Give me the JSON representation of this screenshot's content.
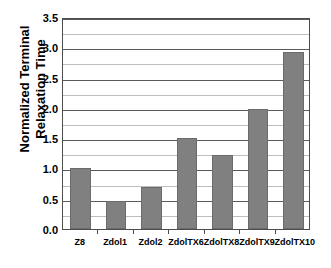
{
  "chart_data": {
    "type": "bar",
    "title": "",
    "xlabel": "",
    "ylabel": "Normalized Terminal Relaxation Time",
    "ylabel_lines": [
      "Normalized Terminal",
      "Relaxation Time"
    ],
    "categories": [
      "Z8",
      "Zdol1",
      "Zdol2",
      "ZdolTX6",
      "ZdolTX8",
      "ZdolTX9",
      "ZdolTX10"
    ],
    "values": [
      1.0,
      0.47,
      0.7,
      1.5,
      1.23,
      1.98,
      2.92
    ],
    "ylim": [
      0.0,
      3.5
    ],
    "ytick_step": 0.5,
    "yticks": [
      "0.0",
      "0.5",
      "1.0",
      "1.5",
      "2.0",
      "2.5",
      "3.0",
      "3.5"
    ],
    "ytick_values": [
      0.0,
      0.5,
      1.0,
      1.5,
      2.0,
      2.5,
      3.0,
      3.5
    ],
    "minor_gridline_step": 0.25,
    "grid": true,
    "legend": "none",
    "bar_color": "#808080",
    "bar_edge_color": "#6b6b6b",
    "major_gridline_color": "#5a5a5a",
    "minor_gridline_color": "#bdbdbd",
    "axis_color": "#4d4d4d",
    "plot_background": "#ffffff"
  }
}
